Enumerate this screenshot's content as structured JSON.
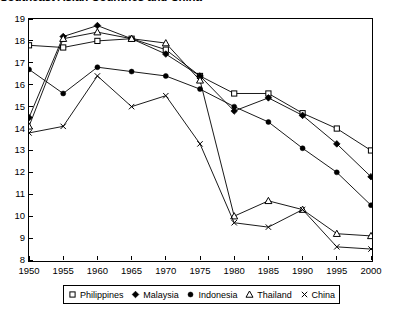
{
  "chart": {
    "title": "Southeast Asian Countries and China"
  },
  "chart_data": {
    "type": "line",
    "title": "Southeast Asian Countries and China",
    "xlabel": "",
    "ylabel": "",
    "xlim": [
      1950,
      2000
    ],
    "ylim": [
      8,
      19
    ],
    "grid": false,
    "legend_position": "bottom",
    "x": [
      1950,
      1955,
      1960,
      1965,
      1970,
      1975,
      1980,
      1985,
      1990,
      1995,
      2000
    ],
    "xticklabels": [
      "1950",
      "1955",
      "1960",
      "1965",
      "1970",
      "1975",
      "1980",
      "1985",
      "1990",
      "1995",
      "2000"
    ],
    "yticklabels": [
      "8",
      "9",
      "10",
      "11",
      "12",
      "13",
      "14",
      "15",
      "16",
      "17",
      "18",
      "19"
    ],
    "series": [
      {
        "name": "Philippines",
        "marker": "open-square",
        "values": [
          17.8,
          17.7,
          18.0,
          18.1,
          17.6,
          16.4,
          15.6,
          15.6,
          14.7,
          14.0,
          13.0
        ]
      },
      {
        "name": "Malaysia",
        "marker": "filled-diamond",
        "values": [
          14.5,
          18.2,
          18.7,
          18.1,
          17.4,
          16.4,
          14.8,
          15.4,
          14.6,
          13.3,
          11.8
        ]
      },
      {
        "name": "Indonesia",
        "marker": "filled-circle",
        "values": [
          16.7,
          15.6,
          16.8,
          16.6,
          16.4,
          15.8,
          15.0,
          14.3,
          13.1,
          12.0,
          10.5
        ]
      },
      {
        "name": "Thailand",
        "marker": "open-triangle",
        "values": [
          14.1,
          18.1,
          18.4,
          18.1,
          17.9,
          16.2,
          10.0,
          10.7,
          10.3,
          9.2,
          9.1
        ]
      },
      {
        "name": "China",
        "marker": "cross",
        "values": [
          13.8,
          14.1,
          16.4,
          15.0,
          15.5,
          13.3,
          9.7,
          9.5,
          10.3,
          8.6,
          8.5
        ]
      }
    ]
  },
  "legend": {
    "items": [
      {
        "label": "Philippines",
        "marker": "open-square"
      },
      {
        "label": "Malaysia",
        "marker": "filled-diamond"
      },
      {
        "label": "Indonesia",
        "marker": "filled-circle"
      },
      {
        "label": "Thailand",
        "marker": "open-triangle"
      },
      {
        "label": "China",
        "marker": "cross"
      }
    ]
  }
}
